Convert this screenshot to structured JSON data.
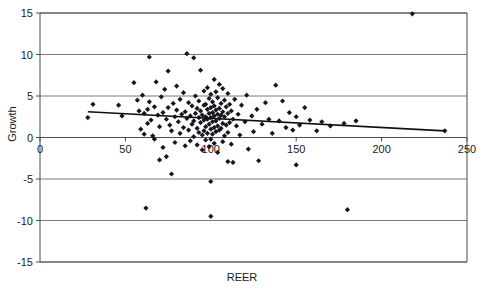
{
  "chart_data": {
    "type": "scatter",
    "title": "",
    "xlabel": "REER",
    "ylabel": "Growth",
    "xlim": [
      0,
      250
    ],
    "ylim": [
      -15,
      15
    ],
    "xticks": [
      0,
      50,
      100,
      150,
      200,
      250
    ],
    "xtick_labels": [
      "0",
      "50",
      "100",
      "150",
      "200",
      "250"
    ],
    "yticks": [
      -15,
      -10,
      -5,
      0,
      5,
      10,
      15
    ],
    "ytick_labels": [
      "-15",
      "-10",
      "-5",
      "0",
      "5",
      "10",
      "15"
    ],
    "grid": "horizontal",
    "legend": "none",
    "marker": "diamond",
    "marker_color": "#16161e",
    "trendline": {
      "type": "linear",
      "color": "#111111",
      "x_start": 28,
      "y_start": 3.1,
      "x_end": 237,
      "y_end": 0.8
    },
    "series": [
      {
        "name": "REER vs Growth",
        "points": [
          [
            28,
            2.4
          ],
          [
            31,
            4.0
          ],
          [
            46,
            3.9
          ],
          [
            48,
            2.6
          ],
          [
            55,
            6.6
          ],
          [
            57,
            4.5
          ],
          [
            58,
            3.2
          ],
          [
            59,
            1.0
          ],
          [
            60,
            5.1
          ],
          [
            61,
            2.9
          ],
          [
            61,
            0.4
          ],
          [
            62,
            -8.5
          ],
          [
            63,
            3.4
          ],
          [
            63,
            1.7
          ],
          [
            64,
            9.7
          ],
          [
            64,
            4.3
          ],
          [
            65,
            2.1
          ],
          [
            66,
            0.2
          ],
          [
            67,
            3.7
          ],
          [
            67,
            -0.2
          ],
          [
            68,
            6.7
          ],
          [
            69,
            2.7
          ],
          [
            70,
            1.3
          ],
          [
            70,
            -2.7
          ],
          [
            71,
            4.9
          ],
          [
            72,
            3.0
          ],
          [
            72,
            -1.2
          ],
          [
            73,
            5.8
          ],
          [
            74,
            2.2
          ],
          [
            74,
            -2.3
          ],
          [
            75,
            8.0
          ],
          [
            75,
            3.6
          ],
          [
            76,
            1.5
          ],
          [
            77,
            0.8
          ],
          [
            77,
            -4.4
          ],
          [
            78,
            4.1
          ],
          [
            79,
            2.5
          ],
          [
            79,
            -0.6
          ],
          [
            80,
            6.2
          ],
          [
            80,
            3.3
          ],
          [
            81,
            1.9
          ],
          [
            82,
            4.6
          ],
          [
            82,
            0.5
          ],
          [
            83,
            2.8
          ],
          [
            84,
            5.4
          ],
          [
            84,
            1.2
          ],
          [
            85,
            3.1
          ],
          [
            85,
            -1.0
          ],
          [
            86,
            10.1
          ],
          [
            86,
            2.3
          ],
          [
            87,
            4.2
          ],
          [
            87,
            0.9
          ],
          [
            88,
            2.6
          ],
          [
            88,
            -0.4
          ],
          [
            89,
            3.8
          ],
          [
            89,
            1.6
          ],
          [
            90,
            9.6
          ],
          [
            90,
            2.0
          ],
          [
            90,
            0.1
          ],
          [
            91,
            5.0
          ],
          [
            91,
            2.9
          ],
          [
            92,
            3.5
          ],
          [
            92,
            1.1
          ],
          [
            92,
            -0.9
          ],
          [
            93,
            4.4
          ],
          [
            93,
            2.4
          ],
          [
            93,
            0.6
          ],
          [
            94,
            8.1
          ],
          [
            94,
            3.2
          ],
          [
            94,
            1.8
          ],
          [
            95,
            2.7
          ],
          [
            95,
            0.3
          ],
          [
            95,
            -1.5
          ],
          [
            96,
            5.6
          ],
          [
            96,
            3.9
          ],
          [
            96,
            2.1
          ],
          [
            96,
            0.8
          ],
          [
            97,
            4.0
          ],
          [
            97,
            2.5
          ],
          [
            97,
            1.3
          ],
          [
            97,
            -0.3
          ],
          [
            98,
            6.0
          ],
          [
            98,
            3.4
          ],
          [
            98,
            2.2
          ],
          [
            98,
            0.5
          ],
          [
            99,
            4.7
          ],
          [
            99,
            2.9
          ],
          [
            99,
            1.6
          ],
          [
            99,
            -1.1
          ],
          [
            100,
            5.2
          ],
          [
            100,
            3.6
          ],
          [
            100,
            2.4
          ],
          [
            100,
            1.0
          ],
          [
            100,
            -0.2
          ],
          [
            100,
            -5.3
          ],
          [
            100,
            -9.5
          ],
          [
            101,
            4.3
          ],
          [
            101,
            3.0
          ],
          [
            101,
            1.9
          ],
          [
            101,
            0.4
          ],
          [
            102,
            7.0
          ],
          [
            102,
            3.8
          ],
          [
            102,
            2.6
          ],
          [
            102,
            1.2
          ],
          [
            102,
            -0.7
          ],
          [
            103,
            5.5
          ],
          [
            103,
            3.3
          ],
          [
            103,
            2.0
          ],
          [
            103,
            0.7
          ],
          [
            104,
            4.8
          ],
          [
            104,
            2.8
          ],
          [
            104,
            1.4
          ],
          [
            104,
            -1.8
          ],
          [
            105,
            6.4
          ],
          [
            105,
            3.5
          ],
          [
            105,
            2.3
          ],
          [
            105,
            0.9
          ],
          [
            106,
            4.1
          ],
          [
            106,
            2.7
          ],
          [
            106,
            1.1
          ],
          [
            107,
            5.9
          ],
          [
            107,
            3.1
          ],
          [
            107,
            1.7
          ],
          [
            107,
            -0.5
          ],
          [
            108,
            4.5
          ],
          [
            108,
            2.5
          ],
          [
            108,
            0.2
          ],
          [
            109,
            3.7
          ],
          [
            109,
            1.5
          ],
          [
            110,
            5.3
          ],
          [
            110,
            2.9
          ],
          [
            110,
            0.6
          ],
          [
            110,
            -2.9
          ],
          [
            111,
            4.0
          ],
          [
            111,
            1.8
          ],
          [
            112,
            3.2
          ],
          [
            112,
            -0.8
          ],
          [
            113,
            2.2
          ],
          [
            113,
            -3.0
          ],
          [
            114,
            4.6
          ],
          [
            115,
            1.4
          ],
          [
            116,
            2.8
          ],
          [
            117,
            0.3
          ],
          [
            118,
            3.9
          ],
          [
            120,
            1.9
          ],
          [
            121,
            5.1
          ],
          [
            122,
            -1.4
          ],
          [
            124,
            2.6
          ],
          [
            125,
            0.7
          ],
          [
            127,
            3.4
          ],
          [
            128,
            -2.8
          ],
          [
            130,
            1.6
          ],
          [
            132,
            4.2
          ],
          [
            134,
            2.2
          ],
          [
            136,
            0.5
          ],
          [
            138,
            6.3
          ],
          [
            140,
            2.0
          ],
          [
            142,
            4.4
          ],
          [
            144,
            1.2
          ],
          [
            146,
            3.0
          ],
          [
            148,
            0.9
          ],
          [
            150,
            2.5
          ],
          [
            150,
            -3.3
          ],
          [
            152,
            1.5
          ],
          [
            155,
            3.6
          ],
          [
            158,
            2.1
          ],
          [
            162,
            0.8
          ],
          [
            165,
            1.9
          ],
          [
            170,
            1.4
          ],
          [
            178,
            1.7
          ],
          [
            180,
            -8.7
          ],
          [
            185,
            2.0
          ],
          [
            218,
            14.9
          ],
          [
            237,
            0.8
          ]
        ]
      }
    ]
  }
}
